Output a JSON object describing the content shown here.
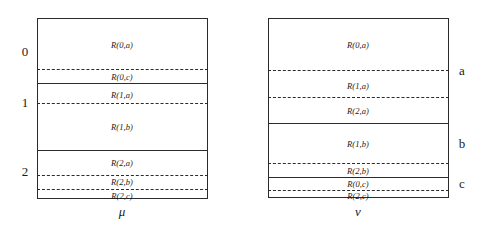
{
  "figure": {
    "title": "",
    "panels": [
      {
        "id": "mu",
        "axis_label": "μ",
        "side_labels": [
          {
            "text": "0",
            "y": 51
          },
          {
            "text": "1",
            "y": 102
          },
          {
            "text": "2",
            "y": 171
          }
        ],
        "box": {
          "x": 37,
          "y": 18,
          "w": 171,
          "h": 181
        },
        "solid_lines": [
          {
            "y": 83
          },
          {
            "y": 150
          }
        ],
        "dashed_lines": [
          {
            "y": 69
          },
          {
            "y": 103
          },
          {
            "y": 175
          },
          {
            "y": 189
          }
        ],
        "cells": [
          {
            "text": "R(0,a)",
            "x": 122,
            "y": 45
          },
          {
            "text": "R(0,c)",
            "x": 122,
            "y": 77
          },
          {
            "text": "R(1,a)",
            "x": 122,
            "y": 95
          },
          {
            "text": "R(1,b)",
            "x": 122,
            "y": 127
          },
          {
            "text": "R(2,a)",
            "x": 122,
            "y": 163
          },
          {
            "text": "R(2,b)",
            "x": 122,
            "y": 182
          },
          {
            "text": "R(2,c)",
            "x": 122,
            "y": 196
          }
        ]
      },
      {
        "id": "nu",
        "axis_label": "ν",
        "side_labels": [
          {
            "text": "a",
            "y": 70
          },
          {
            "text": "b",
            "y": 143
          },
          {
            "text": "c",
            "y": 183
          }
        ],
        "box": {
          "x": 268,
          "y": 18,
          "w": 181,
          "h": 180
        },
        "solid_lines": [
          {
            "y": 123
          },
          {
            "y": 177
          }
        ],
        "dashed_lines": [
          {
            "y": 70
          },
          {
            "y": 97
          },
          {
            "y": 163
          },
          {
            "y": 190
          }
        ],
        "cells": [
          {
            "text": "R(0,a)",
            "x": 358,
            "y": 45
          },
          {
            "text": "R(1,a)",
            "x": 358,
            "y": 86
          },
          {
            "text": "R(2,a)",
            "x": 358,
            "y": 111
          },
          {
            "text": "R(1,b)",
            "x": 358,
            "y": 144
          },
          {
            "text": "R(2,b)",
            "x": 358,
            "y": 171
          },
          {
            "text": "R(0,c)",
            "x": 358,
            "y": 184
          },
          {
            "text": "R(2,c)",
            "x": 358,
            "y": 196
          }
        ]
      }
    ],
    "colors": {
      "ink": "#2b2b2b",
      "background": "#ffffff"
    }
  }
}
